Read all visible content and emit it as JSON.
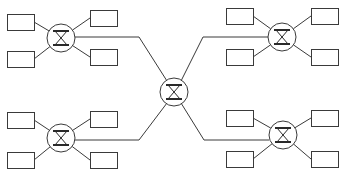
{
  "diagram": {
    "title": "",
    "type": "network-topology",
    "colors": {
      "stroke": "#3a3a3a",
      "fill": "#ffffff",
      "background": "#ffffff"
    },
    "nodes": [
      {
        "id": "hub",
        "kind": "switch",
        "icon": "switch-icon"
      },
      {
        "id": "sw-tl",
        "kind": "switch",
        "icon": "switch-icon"
      },
      {
        "id": "sw-bl",
        "kind": "switch",
        "icon": "switch-icon"
      },
      {
        "id": "sw-tr",
        "kind": "switch",
        "icon": "switch-icon"
      },
      {
        "id": "sw-br",
        "kind": "switch",
        "icon": "switch-icon"
      }
    ],
    "groups": [
      {
        "switch": "sw-tl",
        "hosts": 4
      },
      {
        "switch": "sw-bl",
        "hosts": 4
      },
      {
        "switch": "sw-tr",
        "hosts": 4
      },
      {
        "switch": "sw-br",
        "hosts": 4
      }
    ],
    "edges": [
      [
        "hub",
        "sw-tl"
      ],
      [
        "hub",
        "sw-bl"
      ],
      [
        "hub",
        "sw-tr"
      ],
      [
        "hub",
        "sw-br"
      ]
    ]
  }
}
